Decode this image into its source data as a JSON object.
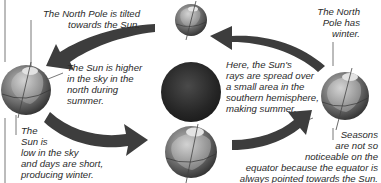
{
  "diagram": {
    "type": "earth-orbit-seasons",
    "colors": {
      "background": "#ffffff",
      "text": "#2a2a2a",
      "arrow": "#3a3a3a",
      "sun": "#2b2b2b",
      "globe_dark": "#4a4a4a",
      "globe_light": "#c8c8c8"
    },
    "nodes": [
      {
        "id": "sun",
        "label": "Sun"
      },
      {
        "id": "earth-top",
        "label": "Earth (top)"
      },
      {
        "id": "earth-left",
        "label": "Earth (left)"
      },
      {
        "id": "earth-bottom",
        "label": "Earth (bottom)"
      },
      {
        "id": "earth-right",
        "label": "Earth (right)"
      }
    ],
    "arrows": [
      {
        "from": "earth-top",
        "to": "earth-left"
      },
      {
        "from": "earth-left",
        "to": "earth-bottom"
      },
      {
        "from": "earth-bottom",
        "to": "earth-right"
      },
      {
        "from": "earth-right",
        "to": "earth-top"
      }
    ]
  },
  "labels": {
    "north_pole_tilted": [
      "The North Pole is tilted",
      "towards the Sun."
    ],
    "sun_higher": [
      "The Sun is higher",
      "in the sky in the",
      "north during",
      "summer."
    ],
    "sun_low": [
      "The",
      "Sun is",
      "low in the sky",
      "and days are short,",
      "producing winter."
    ],
    "north_pole_winter": [
      "The North",
      "Pole has",
      "winter."
    ],
    "rays_spread": [
      "Here, the Sun's",
      "rays are spread over",
      "a small area in the",
      "southern hemisphere,",
      "making summer."
    ],
    "seasons_equator": [
      "Seasons",
      "are not so",
      "noticeable on the",
      "equator because the equator is",
      "always pointed towards the Sun."
    ]
  }
}
